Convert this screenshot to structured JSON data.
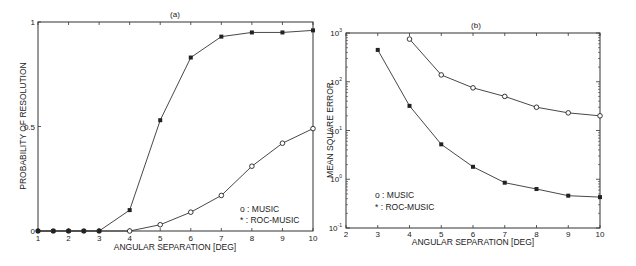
{
  "chart_data": [
    {
      "type": "line",
      "title": "(a)",
      "xlabel": "ANGULAR SEPARATION [DEG]",
      "ylabel": "PROBABILITY OF RESOLUTION",
      "xlim": [
        1,
        10
      ],
      "ylim": [
        0,
        1
      ],
      "xticks": [
        "1",
        "2",
        "3",
        "4",
        "5",
        "6",
        "7",
        "8",
        "9",
        "10"
      ],
      "yticks": [
        "0",
        "0.5",
        "1"
      ],
      "grid": false,
      "legend_position": "lower right inside",
      "series": [
        {
          "name": "MUSIC",
          "marker": "o",
          "x": [
            1,
            1.5,
            2,
            2.5,
            3,
            4,
            5,
            6,
            7,
            8,
            9,
            10
          ],
          "values": [
            0,
            0,
            0,
            0,
            0,
            0,
            0.03,
            0.09,
            0.17,
            0.31,
            0.42,
            0.49
          ]
        },
        {
          "name": "ROC-MUSIC",
          "marker": "*",
          "x": [
            1,
            1.5,
            2,
            2.5,
            3,
            4,
            5,
            6,
            7,
            8,
            9,
            10
          ],
          "values": [
            0,
            0,
            0,
            0,
            0,
            0.1,
            0.53,
            0.83,
            0.93,
            0.95,
            0.95,
            0.96
          ]
        }
      ],
      "legend": [
        "o : MUSIC",
        "* : ROC-MUSIC"
      ]
    },
    {
      "type": "line",
      "title": "(b)",
      "xlabel": "ANGULAR SEPARATION [DEG]",
      "ylabel": "MEAN SQUARE ERROR",
      "xlim": [
        2,
        10
      ],
      "ylim": [
        0.1,
        1000
      ],
      "yscale": "log",
      "xticks": [
        "2",
        "3",
        "4",
        "5",
        "6",
        "7",
        "8",
        "9",
        "10"
      ],
      "yticks": [
        "10^-1",
        "10^0",
        "10^1",
        "10^2",
        "10^3"
      ],
      "grid": false,
      "legend_position": "lower left inside",
      "series": [
        {
          "name": "MUSIC",
          "marker": "o",
          "x": [
            4,
            5,
            6,
            7,
            8,
            9,
            10
          ],
          "values": [
            750,
            138,
            75,
            50,
            30,
            23,
            20
          ]
        },
        {
          "name": "ROC-MUSIC",
          "marker": "*",
          "x": [
            3,
            4,
            5,
            6,
            7,
            8,
            9,
            10
          ],
          "values": [
            450,
            32,
            5.2,
            1.8,
            0.85,
            0.63,
            0.46,
            0.43
          ]
        }
      ],
      "legend": [
        "o : MUSIC",
        "* : ROC-MUSIC"
      ]
    }
  ],
  "labels": {
    "a_title": "(a)",
    "b_title": "(b)",
    "a_xlabel": "ANGULAR SEPARATION [DEG]",
    "a_ylabel": "PROBABILITY OF RESOLUTION",
    "b_xlabel": "ANGULAR SEPARATION [DEG]",
    "b_ylabel": "MEAN SQUARE ERROR",
    "legend_music": "o : MUSIC",
    "legend_roc": "* : ROC-MUSIC"
  }
}
